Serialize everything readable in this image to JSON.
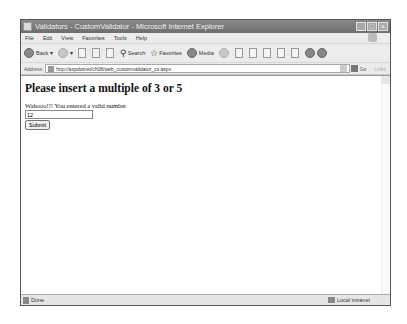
{
  "window": {
    "title": "Validators - CustomValidator - Microsoft Internet Explorer",
    "buttons": {
      "minimize": "_",
      "maximize": "□",
      "close": "×"
    }
  },
  "menubar": {
    "items": [
      "File",
      "Edit",
      "View",
      "Favorites",
      "Tools",
      "Help"
    ]
  },
  "toolbar": {
    "back": "Back",
    "search": "Search",
    "favorites": "Favorites",
    "media": "Media"
  },
  "addressbar": {
    "label": "Address",
    "url": "http://aspdotnet/ch08/web_customvalidator_cs.aspx",
    "go": "Go",
    "links": "Links"
  },
  "page": {
    "heading": "Please insert a multiple of 3 or 5",
    "message": "Wahooo!!! You entered a valid number",
    "input_value": "12",
    "submit_label": "Submit"
  },
  "statusbar": {
    "status": "Done",
    "zone": "Local intranet"
  }
}
